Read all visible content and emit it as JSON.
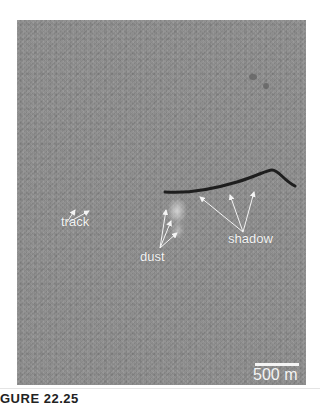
{
  "figure": {
    "labels": {
      "track": "track",
      "dust": "dust",
      "shadow": "shadow"
    },
    "scale_bar": {
      "label": "500 m"
    },
    "caption": "GURE 22.25"
  }
}
